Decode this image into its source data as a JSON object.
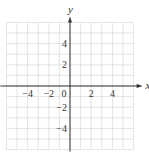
{
  "chart_data": {
    "type": "scatter",
    "title": "",
    "xlabel": "x",
    "ylabel": "y",
    "xlim": [
      -6,
      6
    ],
    "ylim": [
      -6,
      6
    ],
    "grid": true,
    "grid_step": 1,
    "x_ticks": [
      {
        "value": -4,
        "label": "−4"
      },
      {
        "value": -2,
        "label": "−2"
      },
      {
        "value": 0,
        "label": "0"
      },
      {
        "value": 2,
        "label": "2"
      },
      {
        "value": 4,
        "label": "4"
      }
    ],
    "y_ticks": [
      {
        "value": 4,
        "label": "4"
      },
      {
        "value": 2,
        "label": "2"
      },
      {
        "value": -2,
        "label": "−2"
      },
      {
        "value": -4,
        "label": "−4"
      }
    ],
    "series": [],
    "legend": null
  },
  "colors": {
    "grid": "#dcdcdc",
    "axis": "#333333",
    "text": "#333333"
  }
}
